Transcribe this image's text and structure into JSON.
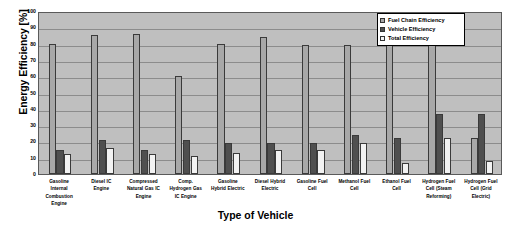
{
  "chart_data": {
    "type": "bar",
    "title": "",
    "xlabel": "Type of Vehicle",
    "ylabel": "Energy Efficiency [%]",
    "ylim": [
      0,
      100
    ],
    "yticks": [
      0,
      10,
      20,
      30,
      40,
      50,
      60,
      70,
      80,
      90,
      100
    ],
    "grid": true,
    "legend_position": "top-right",
    "categories": [
      "Gasoline Internal Combustion Engine",
      "Diesel IC Engine",
      "Compressed Natural Gas IC Engine",
      "Comp. Hydrogen Gas IC Engine",
      "Gasoline Hybrid Electric",
      "Diesel Hybrid Electric",
      "Gasoline Fuel Cell",
      "Methanol Fuel Cell",
      "Ethanol Fuel Cell",
      "Hydrogen Fuel Cell (Steam Reforming)",
      "Hydrogen Fuel Cell (Grid Electric)"
    ],
    "category_lines": [
      [
        "Gasoline",
        "Internal",
        "Combustion",
        "Engine"
      ],
      [
        "Diesel IC",
        "Engine"
      ],
      [
        "Compressed",
        "Natural Gas IC",
        "Engine"
      ],
      [
        "Comp.",
        "Hydrogen Gas",
        "IC Engine"
      ],
      [
        "Gasoline",
        "Hybrid Electric"
      ],
      [
        "Diesel Hybrid",
        "Electric"
      ],
      [
        "Gasoline Fuel",
        "Cell"
      ],
      [
        "Methanol Fuel",
        "Cell"
      ],
      [
        "Ethanol Fuel",
        "Cell"
      ],
      [
        "Hydrogen Fuel",
        "Cell (Steam",
        "Reforming)"
      ],
      [
        "Hydrogen Fuel",
        "Cell (Grid",
        "Electric)"
      ]
    ],
    "series": [
      {
        "name": "Fuel Chain Efficiency",
        "color": "#a8a8a8",
        "values": [
          80,
          85,
          86,
          60,
          80,
          84,
          79,
          79,
          79,
          79,
          22
        ]
      },
      {
        "name": "Vehicle Efficiency",
        "color": "#4f4f4f",
        "values": [
          15,
          21,
          15,
          21,
          19,
          19,
          19,
          24,
          22,
          37,
          37
        ]
      },
      {
        "name": "Total Efficiency",
        "color": "#f2f2f2",
        "values": [
          12,
          16,
          12,
          11,
          13,
          15,
          15,
          19,
          7,
          22,
          8
        ]
      }
    ]
  },
  "legend": {
    "items": [
      {
        "label": "Fuel Chain Efficiency"
      },
      {
        "label": "Vehicle Efficiency"
      },
      {
        "label": "Total Efficiency"
      }
    ]
  }
}
